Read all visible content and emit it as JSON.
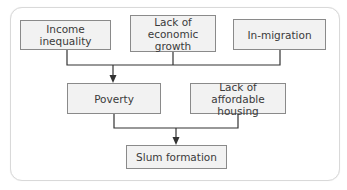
{
  "diagram": {
    "type": "flowchart",
    "nodes": {
      "income_inequality": {
        "label": "Income inequality"
      },
      "economic_growth": {
        "line1": "Lack of",
        "line2": "economic growth"
      },
      "in_migration": {
        "label": "In-migration"
      },
      "poverty": {
        "label": "Poverty"
      },
      "affordable_housing": {
        "line1": "Lack of",
        "line2": "affordable housing"
      },
      "slum_formation": {
        "label": "Slum formation"
      }
    },
    "edges": [
      {
        "from": [
          "Income inequality",
          "Lack of economic growth",
          "In-migration"
        ],
        "to": "Poverty"
      },
      {
        "from": [
          "Poverty",
          "Lack of affordable housing"
        ],
        "to": "Slum formation"
      }
    ],
    "colors": {
      "node_fill": "#f2f2f2",
      "node_border": "#8a8a8a",
      "line": "#333333",
      "frame_border": "#d9d9d9"
    }
  }
}
